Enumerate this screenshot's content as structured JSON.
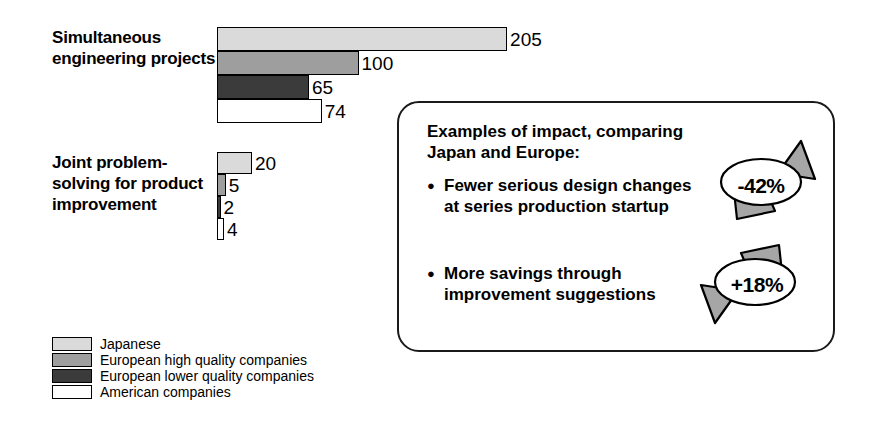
{
  "chart_data": {
    "type": "bar",
    "title": "",
    "orientation": "horizontal",
    "xlabel": "",
    "ylabel": "",
    "grid": false,
    "legend_position": "bottom-left",
    "categories": [
      "Simultaneous engineering projects",
      "Joint problem-solving for product improvement"
    ],
    "series": [
      {
        "name": "Japanese",
        "color": "#dadada",
        "values": [
          205,
          20
        ]
      },
      {
        "name": "European high quality companies",
        "color": "#9e9e9e",
        "values": [
          100,
          5
        ]
      },
      {
        "name": "European lower quality companies",
        "color": "#3b3b3b",
        "values": [
          65,
          2
        ]
      },
      {
        "name": "American companies",
        "color": "#ffffff",
        "values": [
          74,
          4
        ]
      }
    ],
    "annotations": [
      {
        "text": "-42%",
        "refers_to": "Fewer serious design changes at series production startup"
      },
      {
        "text": "+18%",
        "refers_to": "More savings through improvement suggestions"
      }
    ]
  },
  "groups": [
    {
      "label": "Simultaneous engineering projects",
      "px_per_unit": 1.415,
      "bar_height": 24,
      "bars": [
        {
          "series": 0,
          "value": 205,
          "value_label": "205"
        },
        {
          "series": 1,
          "value": 100,
          "value_label": "100"
        },
        {
          "series": 2,
          "value": 65,
          "value_label": "65"
        },
        {
          "series": 3,
          "value": 74,
          "value_label": "74"
        }
      ]
    },
    {
      "label": "Joint problem-solving for product improvement",
      "px_per_unit": 1.75,
      "bar_height": 22,
      "bars": [
        {
          "series": 0,
          "value": 20,
          "value_label": "20"
        },
        {
          "series": 1,
          "value": 5,
          "value_label": "5"
        },
        {
          "series": 2,
          "value": 2,
          "value_label": "2"
        },
        {
          "series": 3,
          "value": 4,
          "value_label": "4"
        }
      ]
    }
  ],
  "legend": {
    "items": [
      {
        "label": "Japanese",
        "color": "#dadada"
      },
      {
        "label": "European high quality companies",
        "color": "#9e9e9e"
      },
      {
        "label": "European lower quality companies",
        "color": "#3b3b3b"
      },
      {
        "label": "American companies",
        "color": "#ffffff"
      }
    ]
  },
  "callout": {
    "heading": "Examples of impact, comparing Japan and Europe:",
    "bullets": [
      "Fewer serious design changes at series production startup",
      "More savings through improvement suggestions"
    ],
    "badges": [
      {
        "text": "-42%",
        "direction": "down-left",
        "fill": "#a6a6a6"
      },
      {
        "text": "+18%",
        "direction": "up-right",
        "fill": "#a6a6a6"
      }
    ]
  },
  "colors": {
    "outline": "#000000",
    "callout_border": "#1a1a1a",
    "arrow_fill": "#a6a6a6",
    "background": "#ffffff"
  }
}
